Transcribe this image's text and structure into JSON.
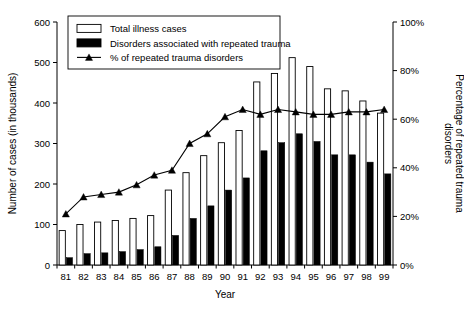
{
  "chart_data": {
    "type": "bar",
    "title": "",
    "xlabel": "Year",
    "ylabel": "Number of cases (in thousands)",
    "y2label": "Percentage of repeated trauma disorders",
    "categories": [
      "81",
      "82",
      "83",
      "84",
      "85",
      "86",
      "87",
      "88",
      "89",
      "90",
      "91",
      "92",
      "93",
      "94",
      "95",
      "96",
      "97",
      "98",
      "99"
    ],
    "ylim": [
      0,
      600
    ],
    "y2lim": [
      0,
      100
    ],
    "yticks": [
      "0",
      "100",
      "200",
      "300",
      "400",
      "500",
      "600"
    ],
    "y2ticks": [
      "0%",
      "20%",
      "40%",
      "60%",
      "80%",
      "100%"
    ],
    "grid": false,
    "legend_position": "top-left-inside",
    "series": [
      {
        "name": "Total illness cases",
        "type": "bar",
        "axis": "left",
        "style": "white-filled-black-outline",
        "values": [
          85,
          100,
          106,
          110,
          115,
          122,
          185,
          228,
          270,
          302,
          332,
          452,
          473,
          512,
          490,
          435,
          430,
          405,
          375
        ]
      },
      {
        "name": "Disorders associated with repeated trauma",
        "type": "bar",
        "axis": "left",
        "style": "black-filled",
        "values": [
          18,
          28,
          30,
          33,
          38,
          45,
          73,
          115,
          146,
          185,
          215,
          282,
          302,
          324,
          305,
          272,
          272,
          254,
          225
        ]
      },
      {
        "name": "% of repeated trauma disorders",
        "type": "line",
        "axis": "right",
        "marker": "triangle",
        "values": [
          21,
          28,
          29,
          30,
          33,
          37,
          39,
          50,
          54,
          61,
          64,
          62,
          64,
          63,
          62,
          62,
          63,
          63,
          64
        ]
      }
    ],
    "legend": [
      {
        "label": "Total illness cases",
        "swatch": "white-box"
      },
      {
        "label": "Disorders associated with repeated trauma",
        "swatch": "black-box"
      },
      {
        "label": "% of repeated trauma disorders",
        "swatch": "line-triangle"
      }
    ]
  }
}
